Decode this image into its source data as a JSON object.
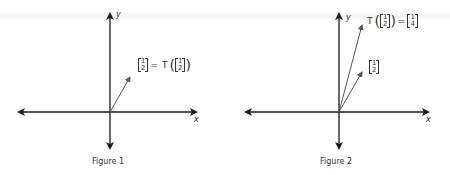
{
  "figures": [
    {
      "caption": "Figure 1",
      "x_axis_label": "x",
      "y_axis_label": "y",
      "vectors": [
        {
          "name": "v",
          "components": [
            "1",
            "2"
          ],
          "end": [
            130,
            77
          ]
        }
      ],
      "label": {
        "left_matrix": [
          "1",
          "2"
        ],
        "equals": "=",
        "func": "T",
        "right_matrix": [
          "1",
          "2"
        ]
      }
    },
    {
      "caption": "Figure 2",
      "x_axis_label": "x",
      "y_axis_label": "y",
      "vectors": [
        {
          "name": "v",
          "components": [
            "1",
            "2"
          ],
          "end": [
            362,
            72
          ]
        },
        {
          "name": "Tv",
          "components": [
            "1",
            "4"
          ],
          "end": [
            362,
            25
          ]
        }
      ],
      "label_T": {
        "func": "T",
        "arg_matrix": [
          "1",
          "2"
        ],
        "equals": "=",
        "result_matrix": [
          "1",
          "4"
        ]
      },
      "label_v": {
        "matrix": [
          "1",
          "2"
        ]
      }
    }
  ],
  "colors": {
    "axis": "#1a1a1a",
    "vector": "#555555",
    "text": "#333333"
  }
}
